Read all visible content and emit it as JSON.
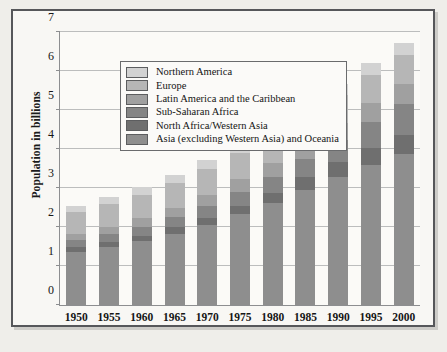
{
  "chart_data": {
    "type": "bar",
    "stacked": true,
    "title": "",
    "subtitle": "",
    "xlabel": "",
    "ylabel": "Population in billions",
    "categories": [
      "1950",
      "1955",
      "1960",
      "1965",
      "1970",
      "1975",
      "1980",
      "1985",
      "1990",
      "1995",
      "2000"
    ],
    "ylim": [
      0,
      7
    ],
    "yticks": [
      0,
      1,
      2,
      3,
      4,
      5,
      6,
      7
    ],
    "ytick_labels": [
      "0",
      "1",
      "2",
      "3",
      "4",
      "5",
      "6",
      "7"
    ],
    "grid": true,
    "legend_position": "upper-left inside plot",
    "series": [
      {
        "name": "Asia (excluding Western Asia) and Oceania",
        "color": "#8e8e8e",
        "values": [
          1.37,
          1.5,
          1.64,
          1.83,
          2.05,
          2.33,
          2.62,
          2.96,
          3.29,
          3.6,
          3.88
        ]
      },
      {
        "name": "North Africa/Western Asia",
        "color": "#6f6f6f",
        "values": [
          0.11,
          0.12,
          0.14,
          0.16,
          0.19,
          0.22,
          0.26,
          0.31,
          0.37,
          0.43,
          0.49
        ]
      },
      {
        "name": "Sub-Saharan Africa",
        "color": "#858585",
        "values": [
          0.18,
          0.2,
          0.23,
          0.26,
          0.3,
          0.35,
          0.41,
          0.48,
          0.57,
          0.67,
          0.78
        ]
      },
      {
        "name": "Latin America and the Caribbean",
        "color": "#a0a0a0",
        "values": [
          0.17,
          0.19,
          0.22,
          0.25,
          0.29,
          0.32,
          0.36,
          0.4,
          0.44,
          0.48,
          0.52
        ]
      },
      {
        "name": "Europe",
        "color": "#b6b6b6",
        "values": [
          0.55,
          0.58,
          0.6,
          0.63,
          0.66,
          0.68,
          0.69,
          0.7,
          0.72,
          0.73,
          0.73
        ]
      },
      {
        "name": "Northern America",
        "color": "#d2d2d2",
        "values": [
          0.17,
          0.19,
          0.2,
          0.21,
          0.23,
          0.24,
          0.25,
          0.27,
          0.28,
          0.3,
          0.31
        ]
      }
    ],
    "totals": [
      2.55,
      2.78,
      3.03,
      3.34,
      3.72,
      4.14,
      4.59,
      5.12,
      5.67,
      6.21,
      6.71
    ],
    "colors": {
      "plot_background": "#fbfaf7",
      "page_background": "#efeeea",
      "grid": "#bcbdbd",
      "axis": "#8d8e90",
      "frame": "#56575a",
      "text": "#161616"
    }
  },
  "legend": {
    "items": [
      {
        "label": "Northern America",
        "color": "#d2d2d2"
      },
      {
        "label": "Europe",
        "color": "#b6b6b6"
      },
      {
        "label": "Latin America and the Caribbean",
        "color": "#a0a0a0"
      },
      {
        "label": "Sub-Saharan Africa",
        "color": "#858585"
      },
      {
        "label": "North Africa/Western Asia",
        "color": "#6f6f6f"
      },
      {
        "label": "Asia (excluding Western Asia) and Oceania",
        "color": "#8e8e8e"
      }
    ]
  }
}
